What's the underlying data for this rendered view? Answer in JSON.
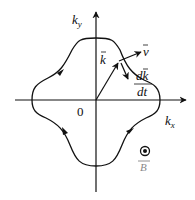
{
  "diagram": {
    "type": "fermi-surface-orbit",
    "axes": {
      "x_label": "k",
      "x_sub": "x",
      "y_label": "k",
      "y_sub": "y",
      "origin_label": "0"
    },
    "vectors": {
      "k_label": "k",
      "v_label": "v",
      "dkdt_num": "dk",
      "dkdt_den": "dt"
    },
    "field": {
      "symbol": "⊙",
      "label": "B"
    },
    "colors": {
      "line": "#111111",
      "background": "#ffffff"
    }
  }
}
